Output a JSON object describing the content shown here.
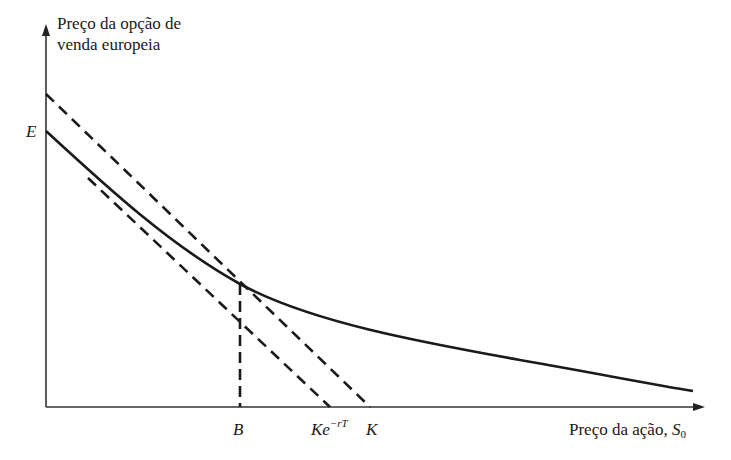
{
  "diagram": {
    "y_axis_label_line1": "Preço da opção de",
    "y_axis_label_line2": "venda europeia",
    "x_axis_label": "Preço da ação, ",
    "x_axis_var": "S",
    "x_axis_var_sub": "0",
    "label_E": "E",
    "label_B": "B",
    "label_Ke": "Ke",
    "label_Ke_exp": "−rT",
    "label_K": "K",
    "line_color": "#1a1a1a"
  }
}
